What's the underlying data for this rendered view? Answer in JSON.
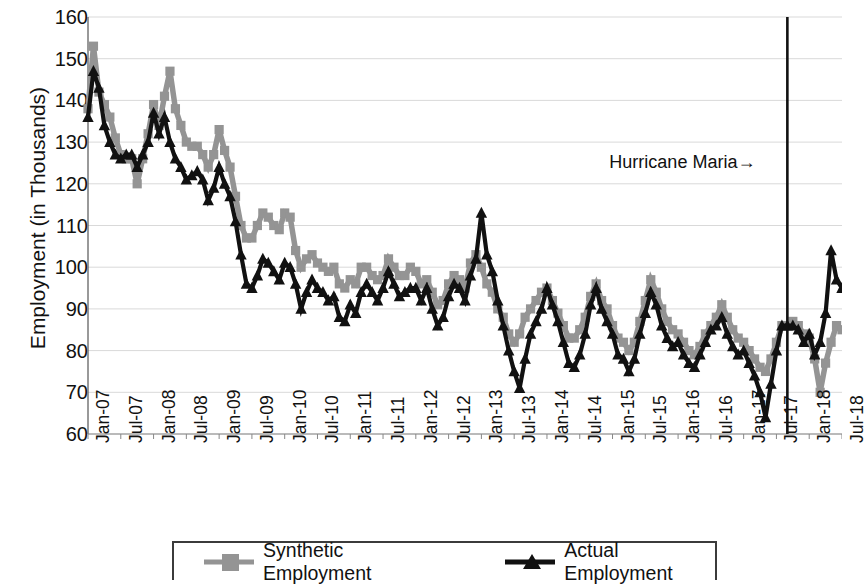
{
  "chart_data": {
    "type": "line",
    "title": "",
    "xlabel": "",
    "ylabel": "Employment (in Thousands)",
    "ylim": [
      60,
      160
    ],
    "ytick_step": 10,
    "yticks": [
      160,
      150,
      140,
      130,
      120,
      110,
      100,
      90,
      80,
      70,
      60
    ],
    "grid": "horizontal",
    "legend_position": "bottom",
    "x_tick_rotation_deg": -90,
    "x_tick_interval_months": 6,
    "x_start": "Jan-07",
    "x_end": "Jul-18",
    "x": [
      "Jan-07",
      "Feb-07",
      "Mar-07",
      "Apr-07",
      "May-07",
      "Jun-07",
      "Jul-07",
      "Aug-07",
      "Sep-07",
      "Oct-07",
      "Nov-07",
      "Dec-07",
      "Jan-08",
      "Feb-08",
      "Mar-08",
      "Apr-08",
      "May-08",
      "Jun-08",
      "Jul-08",
      "Aug-08",
      "Sep-08",
      "Oct-08",
      "Nov-08",
      "Dec-08",
      "Jan-09",
      "Feb-09",
      "Mar-09",
      "Apr-09",
      "May-09",
      "Jun-09",
      "Jul-09",
      "Aug-09",
      "Sep-09",
      "Oct-09",
      "Nov-09",
      "Dec-09",
      "Jan-10",
      "Feb-10",
      "Mar-10",
      "Apr-10",
      "May-10",
      "Jun-10",
      "Jul-10",
      "Aug-10",
      "Sep-10",
      "Oct-10",
      "Nov-10",
      "Dec-10",
      "Jan-11",
      "Feb-11",
      "Mar-11",
      "Apr-11",
      "May-11",
      "Jun-11",
      "Jul-11",
      "Aug-11",
      "Sep-11",
      "Oct-11",
      "Nov-11",
      "Dec-11",
      "Jan-12",
      "Feb-12",
      "Mar-12",
      "Apr-12",
      "May-12",
      "Jun-12",
      "Jul-12",
      "Aug-12",
      "Sep-12",
      "Oct-12",
      "Nov-12",
      "Dec-12",
      "Jan-13",
      "Feb-13",
      "Mar-13",
      "Apr-13",
      "May-13",
      "Jun-13",
      "Jul-13",
      "Aug-13",
      "Sep-13",
      "Oct-13",
      "Nov-13",
      "Dec-13",
      "Jan-14",
      "Feb-14",
      "Mar-14",
      "Apr-14",
      "May-14",
      "Jun-14",
      "Jul-14",
      "Aug-14",
      "Sep-14",
      "Oct-14",
      "Nov-14",
      "Dec-14",
      "Jan-15",
      "Feb-15",
      "Mar-15",
      "Apr-15",
      "May-15",
      "Jun-15",
      "Jul-15",
      "Aug-15",
      "Sep-15",
      "Oct-15",
      "Nov-15",
      "Dec-15",
      "Jan-16",
      "Feb-16",
      "Mar-16",
      "Apr-16",
      "May-16",
      "Jun-16",
      "Jul-16",
      "Aug-16",
      "Sep-16",
      "Oct-16",
      "Nov-16",
      "Dec-16",
      "Jan-17",
      "Feb-17",
      "Mar-17",
      "Apr-17",
      "May-17",
      "Jun-17",
      "Jul-17",
      "Aug-17",
      "Sep-17",
      "Oct-17",
      "Nov-17",
      "Dec-17",
      "Jan-18",
      "Feb-18",
      "Mar-18",
      "Apr-18",
      "May-18",
      "Jun-18",
      "Jul-18"
    ],
    "x_tick_labels": [
      "Jan-07",
      "Jul-07",
      "Jan-08",
      "Jul-08",
      "Jan-09",
      "Jul-09",
      "Jan-10",
      "Jul-10",
      "Jan-11",
      "Jul-11",
      "Jan-12",
      "Jul-12",
      "Jan-13",
      "Jul-13",
      "Jan-14",
      "Jul-14",
      "Jan-15",
      "Jul-15",
      "Jan-16",
      "Jul-16",
      "Jan-17",
      "Jul-17",
      "Jan-18",
      "Jul-18"
    ],
    "series": [
      {
        "name": "Synthetic Employment",
        "color": "#949494",
        "marker": "square",
        "values": [
          138,
          153,
          142,
          139,
          136,
          131,
          127,
          126,
          126,
          120,
          126,
          132,
          139,
          134,
          141,
          147,
          138,
          134,
          130,
          129,
          129,
          127,
          124,
          127,
          133,
          128,
          124,
          117,
          110,
          107,
          107,
          110,
          113,
          112,
          110,
          109,
          113,
          112,
          104,
          100,
          102,
          103,
          101,
          100,
          99,
          100,
          96,
          95,
          97,
          96,
          100,
          100,
          98,
          97,
          98,
          102,
          100,
          98,
          98,
          100,
          99,
          96,
          97,
          94,
          91,
          92,
          96,
          98,
          97,
          95,
          101,
          103,
          100,
          96,
          94,
          90,
          88,
          84,
          82,
          84,
          88,
          90,
          92,
          94,
          95,
          92,
          89,
          86,
          83,
          83,
          85,
          88,
          93,
          96,
          92,
          90,
          86,
          83,
          82,
          80,
          82,
          87,
          92,
          97,
          94,
          90,
          87,
          85,
          84,
          82,
          80,
          79,
          81,
          84,
          86,
          88,
          91,
          88,
          85,
          83,
          82,
          80,
          78,
          76,
          75,
          78,
          82,
          86,
          86,
          87,
          86,
          84,
          83,
          78,
          70,
          77,
          82,
          86,
          85
        ]
      },
      {
        "name": "Actual Employment",
        "color": "#111111",
        "marker": "triangle",
        "values": [
          136,
          147,
          143,
          134,
          130,
          127,
          126,
          127,
          127,
          124,
          127,
          130,
          137,
          132,
          136,
          130,
          126,
          124,
          121,
          122,
          123,
          121,
          116,
          119,
          124,
          120,
          117,
          111,
          103,
          96,
          95,
          98,
          102,
          101,
          99,
          97,
          101,
          100,
          96,
          90,
          94,
          97,
          95,
          94,
          92,
          93,
          88,
          87,
          91,
          89,
          94,
          96,
          94,
          92,
          95,
          99,
          96,
          93,
          94,
          95,
          95,
          92,
          95,
          90,
          86,
          88,
          93,
          96,
          95,
          92,
          98,
          102,
          113,
          103,
          99,
          92,
          86,
          80,
          75,
          71,
          78,
          84,
          87,
          90,
          95,
          91,
          87,
          82,
          77,
          76,
          79,
          84,
          91,
          95,
          90,
          87,
          84,
          79,
          78,
          75,
          78,
          84,
          89,
          94,
          91,
          86,
          83,
          81,
          82,
          79,
          77,
          76,
          79,
          82,
          85,
          86,
          88,
          84,
          81,
          79,
          80,
          77,
          74,
          70,
          64,
          72,
          80,
          86,
          86,
          86,
          85,
          82,
          84,
          79,
          82,
          89,
          104,
          97,
          95
        ]
      }
    ],
    "annotations": [
      {
        "text": "Hurricane Maria→",
        "at_x": "Sep-17",
        "kind": "vertical-line-with-label"
      }
    ]
  },
  "legend": {
    "entries": [
      {
        "label": "Synthetic Employment"
      },
      {
        "label": "Actual Employment"
      }
    ]
  }
}
